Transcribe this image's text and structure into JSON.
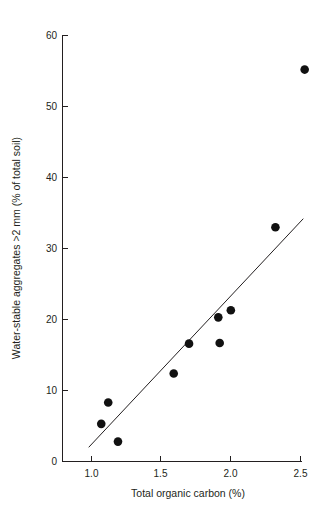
{
  "chart_data": {
    "type": "scatter",
    "title": "",
    "subtitle": "",
    "xlabel": "Total organic carbon (%)",
    "ylabel": "Water-stable aggregates >2 mm (% of total soil)",
    "xlim": [
      0.85,
      2.56
    ],
    "ylim": [
      0,
      60
    ],
    "xticks": [
      1.0,
      1.5,
      2.0,
      2.5
    ],
    "xticklabels": [
      "1.0",
      "1.5",
      "2.0",
      "2.5"
    ],
    "yticks": [
      0,
      10,
      20,
      30,
      40,
      50,
      60
    ],
    "yticklabels": [
      "0",
      "10",
      "20",
      "30",
      "40",
      "50",
      "60"
    ],
    "grid": false,
    "legend": null,
    "legend_position": "none",
    "marker": "filled-circle",
    "marker_color": "#111111",
    "marker_size_px": 4.3,
    "points": [
      {
        "x": 1.07,
        "y": 5.3
      },
      {
        "x": 1.12,
        "y": 8.3
      },
      {
        "x": 1.19,
        "y": 2.8
      },
      {
        "x": 1.59,
        "y": 12.4
      },
      {
        "x": 1.7,
        "y": 16.6
      },
      {
        "x": 1.91,
        "y": 20.3
      },
      {
        "x": 1.92,
        "y": 16.7
      },
      {
        "x": 2.0,
        "y": 21.3
      },
      {
        "x": 2.32,
        "y": 33.0
      },
      {
        "x": 2.53,
        "y": 55.2
      }
    ],
    "trendline": {
      "type": "linear-fit",
      "color": "#231f20",
      "x_start": 0.98,
      "y_start": 2.0,
      "x_end": 2.52,
      "y_end": 34.2
    },
    "annotations": []
  },
  "axis": {
    "x_axis_name": "x-axis",
    "y_axis_name": "y-axis"
  }
}
